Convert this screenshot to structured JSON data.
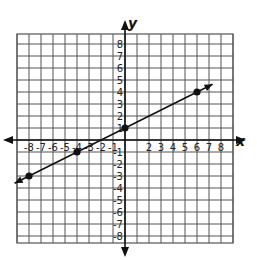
{
  "chart_data": {
    "type": "line",
    "title": "",
    "xlabel": "x",
    "ylabel": "y",
    "xlim": [
      -9,
      9
    ],
    "ylim": [
      -9,
      9
    ],
    "grid": true,
    "x_tick_labels": [
      "-8",
      "-7",
      "-6",
      "-5",
      "-4",
      "-3",
      "-2",
      "-1",
      "2",
      "3",
      "4",
      "5",
      "6",
      "7",
      "8"
    ],
    "y_tick_labels": [
      "8",
      "7",
      "6",
      "5",
      "4",
      "3",
      "2",
      "1",
      "-1",
      "-2",
      "-3",
      "-4",
      "-5",
      "-6",
      "-7",
      "-8"
    ],
    "series": [
      {
        "name": "line",
        "points": [
          [
            -8,
            -3
          ],
          [
            -4,
            -1
          ],
          [
            0,
            1
          ],
          [
            6,
            4
          ]
        ],
        "equation": "y = 0.5x + 1",
        "arrows": "both"
      }
    ]
  },
  "axes": {
    "x_label": "x",
    "y_label": "y"
  },
  "style": {
    "grid_color": "#555555",
    "line_color": "#111111"
  }
}
